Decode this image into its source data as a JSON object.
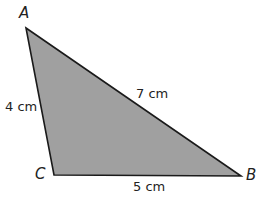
{
  "diagram": {
    "type": "triangle",
    "fill_color": "#a0a0a0",
    "stroke_color": "#1a1a1a",
    "vertices": [
      {
        "name": "A",
        "x": 26,
        "y": 28
      },
      {
        "name": "B",
        "x": 241,
        "y": 176
      },
      {
        "name": "C",
        "x": 54,
        "y": 175
      }
    ],
    "labels": {
      "vertex_a": "A",
      "vertex_b": "B",
      "vertex_c": "C",
      "side_ac": "4 cm",
      "side_ab": "7 cm",
      "side_cb": "5 cm"
    }
  }
}
